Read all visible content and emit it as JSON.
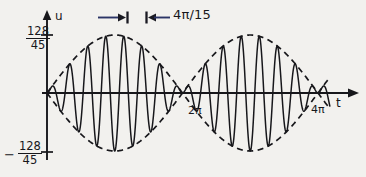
{
  "figure": {
    "kind": "beat-waveform-plot",
    "background_color": "#f2f1ee",
    "ink_color": "#17171b",
    "annotation_color": "#2b3566"
  },
  "axes": {
    "y_axis_label": "u",
    "x_axis_label": "t",
    "y_tick_positive": {
      "numerator": "128",
      "denominator": "45"
    },
    "y_tick_negative": {
      "sign": "−",
      "numerator": "128",
      "denominator": "45"
    },
    "x_tick_mid_label": "2π",
    "x_tick_end_label": "4π"
  },
  "annotation": {
    "period_label": "4π/15",
    "marker_left_icon": "dimension-arrow-right",
    "marker_right_icon": "dimension-arrow-left"
  },
  "chart_data": {
    "type": "line",
    "title": "",
    "xlabel": "t",
    "ylabel": "u",
    "xlim": [
      0,
      13.9
    ],
    "ylim": [
      -2.8444,
      2.8444
    ],
    "grid": false,
    "legend": null,
    "amplitude": 2.8444,
    "amplitude_expression": "128/45",
    "carrier_period": "4π/15",
    "carrier_angular_frequency": 7.5,
    "envelope_period": "4π",
    "envelope_angular_frequency": 0.5,
    "x_ticks": [
      6.2832,
      12.5664
    ],
    "x_tick_labels": [
      "2π",
      "4π"
    ],
    "y_ticks": [
      2.8444,
      -2.8444
    ],
    "y_tick_labels": [
      "128/45",
      "−128/45"
    ],
    "series": [
      {
        "name": "carrier",
        "style": "solid",
        "formula": "u(t) = (128/45) * sin(t/2) * sin(15t/2)"
      },
      {
        "name": "envelope-upper",
        "style": "dashed",
        "formula": "u(t) = (128/45) * |sin(t/2)|"
      },
      {
        "name": "envelope-lower",
        "style": "dashed",
        "formula": "u(t) = -(128/45) * |sin(t/2)|"
      }
    ]
  }
}
